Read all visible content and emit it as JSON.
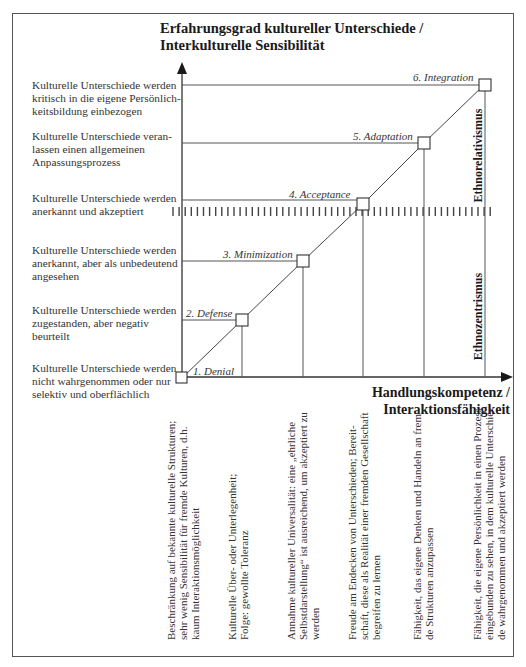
{
  "title": {
    "line1": "Erfahrungsgrad kultureller Unterschiede /",
    "line2": "Interkulturelle Sensibilität"
  },
  "x_axis": {
    "line1": "Handlungskompetenz /",
    "line2": "Interaktionsfähigkeit"
  },
  "levels": [
    {
      "line1": "Kulturelle Unterschiede werden",
      "line2": "kritisch in die eigene Persönlich-",
      "line3": "keitsbildung einbezogen"
    },
    {
      "line1": "Kulturelle Unterschiede veran-",
      "line2": "lassen einen allgemeinen",
      "line3": "Anpassungsprozess"
    },
    {
      "line1": "Kulturelle Unterschiede werden",
      "line2": "anerkannt und akzeptiert",
      "line3": ""
    },
    {
      "line1": "Kulturelle Unterschiede werden",
      "line2": "anerkannt, aber als unbedeutend",
      "line3": "angesehen"
    },
    {
      "line1": "Kulturelle Unterschiede werden",
      "line2": "zugestanden, aber negativ",
      "line3": "beurteilt"
    },
    {
      "line1": "Kulturelle Unterschiede werden",
      "line2": "nicht wahrgenommen oder nur",
      "line3": "selektiv und oberflächlich"
    }
  ],
  "stages": [
    {
      "label": "1. Denial"
    },
    {
      "label": "2. Defense"
    },
    {
      "label": "3. Minimization"
    },
    {
      "label": "4. Acceptance"
    },
    {
      "label": "5. Adaptation"
    },
    {
      "label": "6. Integration"
    }
  ],
  "eras": {
    "upper": "Ethnorelativismus",
    "lower": "Ethnozentrismus"
  },
  "competencies": [
    {
      "line1": "Beschränkung auf bekannte kulturelle Strukturen;",
      "line2": "sehr wenig Sensibilität für fremde Kulturen, d.h.",
      "line3": "kaum Interaktionsmöglichkeit"
    },
    {
      "line1": "Kulturelle Über- oder Unterlegenheit;",
      "line2": "Folge: gewollte Toleranz",
      "line3": ""
    },
    {
      "line1": "Annahme kultureller Universalität: eine „ehrliche",
      "line2": "Selbstdarstellung“ ist ausreichend, um akzeptiert zu",
      "line3": "werden"
    },
    {
      "line1": "Freude am Endecken von Unterschieden; Bereit-",
      "line2": "schaft, diese als Realität einer fremden Gesellschaft",
      "line3": "begreifen zu lernen"
    },
    {
      "line1": "Fähigkeit, das eigene Denken und Handeln an frem-",
      "line2": "de Strukturen anzupassen",
      "line3": ""
    },
    {
      "line1": "Fähigkeit, die eigene Persönlichkeit in einen Prozess",
      "line2": "eingebunden zu sehen, in dem kulturelle Unterschie-",
      "line3": "de wahrgenommen und akzeptiert werden"
    }
  ]
}
